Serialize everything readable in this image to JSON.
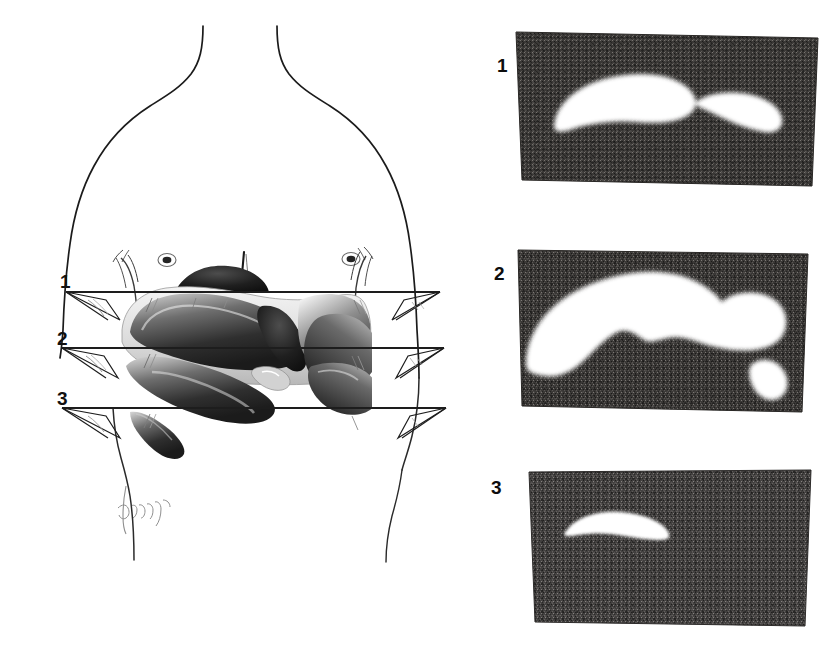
{
  "figure": {
    "kind": "anatomical-illustration-with-scintigrams",
    "background_color": "#ffffff",
    "width": 839,
    "height": 655,
    "caption": "",
    "artist_signature": "Ulrich"
  },
  "body_diagram": {
    "name": "anterior-thorax-outline",
    "description": "Line drawing of human thorax, anterior view, with liver and diaphragm rendered in tone, crossed by three transverse section planes.",
    "outline_color": "#1a1a1a",
    "organ_tone_color": "#4a4a4a",
    "features": [
      {
        "name": "neck",
        "label": ""
      },
      {
        "name": "left-shoulder",
        "label": ""
      },
      {
        "name": "right-shoulder",
        "label": ""
      },
      {
        "name": "sternum-line",
        "label": ""
      },
      {
        "name": "nipple-left",
        "label": ""
      },
      {
        "name": "nipple-right",
        "label": ""
      },
      {
        "name": "liver",
        "label": ""
      },
      {
        "name": "diaphragm",
        "label": ""
      },
      {
        "name": "costal-margin-left",
        "label": ""
      },
      {
        "name": "costal-margin-right",
        "label": ""
      }
    ],
    "section_planes": [
      {
        "label": "1",
        "y": 292,
        "name": "section-plane-1"
      },
      {
        "label": "2",
        "y": 348,
        "name": "section-plane-2"
      },
      {
        "label": "3",
        "y": 408,
        "name": "section-plane-3"
      }
    ]
  },
  "scans": [
    {
      "label": "1",
      "name": "scintigram-1",
      "description": "Transverse scintigram at plane 1: two separate white uptake areas, a large crescent on the left and a smaller elongated one on the right.",
      "background_color": "#3a3836",
      "uptake_color": "#ffffff",
      "blob_count": 2
    },
    {
      "label": "2",
      "name": "scintigram-2",
      "description": "Transverse scintigram at plane 2: one large confluent white uptake area spanning most of the field with a notch, plus a small separate white area at lower right.",
      "background_color": "#3a3836",
      "uptake_color": "#ffffff",
      "blob_count": 2
    },
    {
      "label": "3",
      "name": "scintigram-3",
      "description": "Transverse scintigram at plane 3: a single small white crescent of uptake in the upper left quadrant of the field.",
      "background_color": "#434140",
      "uptake_color": "#ffffff",
      "blob_count": 1
    }
  ]
}
